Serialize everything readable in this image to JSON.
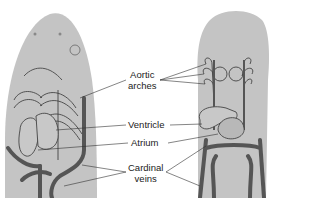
{
  "figure": {
    "left_view": "ventral view of embryo head region",
    "right_view": "dorsal view of embryo heart and vessels"
  },
  "labels": {
    "aortic_arches_line1": "Aortic",
    "aortic_arches_line2": "arches",
    "ventricle": "Ventricle",
    "atrium": "Atrium",
    "cardinal_veins_line1": "Cardinal",
    "cardinal_veins_line2": "veins"
  },
  "colors": {
    "body": "#c4c4c4",
    "vessel": "#555555",
    "outline": "#444444",
    "background": "#ffffff"
  }
}
